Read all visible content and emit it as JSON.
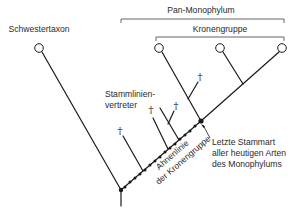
{
  "labels": {
    "sister_taxon": "Schwestertaxon",
    "pan_monophylum": "Pan-Monophylum",
    "crown_group": "Kronengruppe",
    "stem_line_1": "Stammlinien-",
    "stem_line_2": "vertreter",
    "ancestral_line_1": "Ahnenlinie",
    "ancestral_line_2": "der Kronengruppe",
    "last_ancestor_1": "Letzte Stammart",
    "last_ancestor_2": "aller heutigen Arten",
    "last_ancestor_3": "des Monophylums",
    "extinct_symbol": "†"
  },
  "colors": {
    "line": "#1a1a1a",
    "bracket": "#555555",
    "text": "#2a2a2a",
    "node_fill": "#ffffff"
  }
}
